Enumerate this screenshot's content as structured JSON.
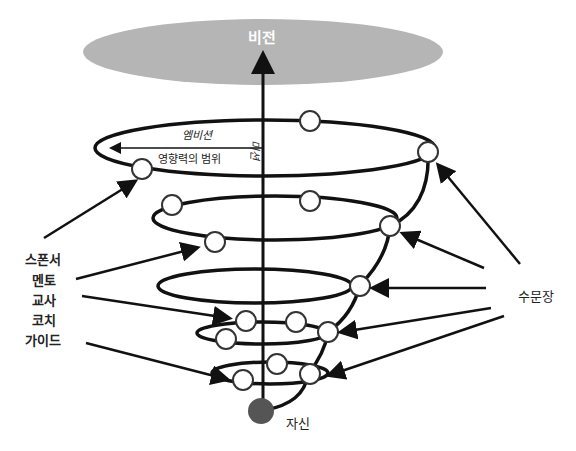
{
  "diagram": {
    "title_vision": "비전",
    "ambition": "엠비션",
    "sphere_of_influence": "영향력의 범위",
    "mission": "미션",
    "self": "자신",
    "gatekeeper": "수문장",
    "roles": [
      "스폰서",
      "멘토",
      "교사",
      "코치",
      "가이드"
    ]
  },
  "colors": {
    "vision_ellipse": "#b5b5b5",
    "self_node": "#555555",
    "line": "#111111",
    "node_fill": "#ffffff"
  }
}
